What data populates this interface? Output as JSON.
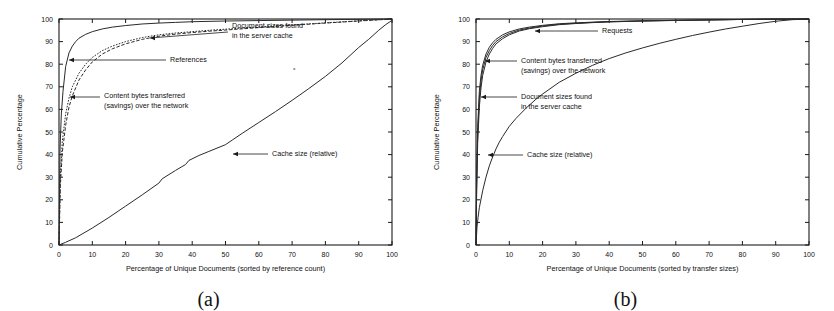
{
  "figure": {
    "caption_a": "(a)",
    "caption_b": "(b)",
    "background": "#ffffff",
    "ink": "#1a1a1a"
  },
  "chart_data": [
    {
      "panel": "a",
      "type": "line",
      "title": "",
      "xlabel": "Percentage of Unique Documents (sorted by reference count)",
      "ylabel": "Cumulative Percentage",
      "xlim": [
        0,
        100
      ],
      "ylim": [
        0,
        100
      ],
      "xticks": [
        0,
        10,
        20,
        30,
        40,
        50,
        60,
        70,
        80,
        90,
        100
      ],
      "yticks": [
        0,
        10,
        20,
        30,
        40,
        50,
        60,
        70,
        80,
        90,
        100
      ],
      "grid": false,
      "legend": "inline-annotations",
      "series": [
        {
          "name": "References",
          "style": "solid",
          "x": [
            0,
            0.3,
            0.7,
            1.2,
            2,
            3,
            4,
            5,
            6,
            8,
            10,
            13,
            16,
            20,
            25,
            30,
            35,
            40,
            50,
            60,
            70,
            80,
            90,
            100
          ],
          "y": [
            0,
            42,
            58,
            68,
            79,
            85,
            88,
            90,
            91.5,
            93.2,
            94.4,
            95.6,
            96.4,
            97.1,
            97.8,
            98.2,
            98.5,
            98.8,
            99.1,
            99.3,
            99.5,
            99.7,
            99.85,
            100
          ]
        },
        {
          "name": "Document sizes found in the server cache",
          "style": "dotted",
          "x": [
            0,
            0.4,
            1,
            2,
            3,
            4,
            6,
            8,
            10,
            13,
            16,
            20,
            25,
            30,
            35,
            40,
            45,
            50,
            60,
            70,
            80,
            90,
            100
          ],
          "y": [
            0,
            30,
            46,
            58,
            65,
            70,
            76,
            80,
            83,
            86,
            88,
            90,
            91.8,
            93,
            93.8,
            94.4,
            95,
            95.5,
            96.5,
            97.4,
            98.3,
            99.2,
            100
          ]
        },
        {
          "name": "Content bytes transferred (savings) over the network",
          "style": "dashed",
          "x": [
            0,
            0.4,
            1,
            2,
            3,
            4,
            6,
            8,
            10,
            13,
            16,
            20,
            25,
            30,
            35,
            40,
            45,
            50,
            60,
            70,
            80,
            90,
            100
          ],
          "y": [
            0,
            26,
            41,
            53,
            61,
            66,
            73,
            77.5,
            81,
            84.5,
            86.8,
            89,
            91,
            92.4,
            93.3,
            94,
            94.6,
            95.1,
            96.2,
            97.2,
            98.2,
            99.1,
            100
          ]
        },
        {
          "name": "Cache size (relative)",
          "style": "solid",
          "x": [
            0,
            2,
            5,
            10,
            15,
            18,
            20,
            25,
            30,
            31,
            35,
            38,
            39,
            42,
            45,
            50,
            52,
            55,
            60,
            65,
            70,
            75,
            80,
            85,
            90,
            93,
            96,
            98,
            100
          ],
          "y": [
            0,
            1.2,
            3.2,
            7.5,
            12.2,
            15.2,
            17.2,
            22.2,
            27.4,
            29.3,
            33.0,
            35.6,
            37.4,
            39.6,
            41.4,
            44.4,
            46.4,
            49.4,
            54.2,
            59.0,
            64.0,
            69.2,
            74.6,
            80.6,
            87.4,
            91.0,
            95.0,
            97.4,
            99.4
          ]
        }
      ],
      "annotations": [
        {
          "text_lines": [
            "Document sizes found",
            "in the server cache"
          ],
          "target_x": 31,
          "target_y": 94
        },
        {
          "text_lines": [
            "References"
          ],
          "target_x": 2,
          "target_y": 82
        },
        {
          "text_lines": [
            "Content bytes transferred",
            "(savings) over the network"
          ],
          "target_x": 1.2,
          "target_y": 68
        },
        {
          "text_lines": [
            "Cache size (relative)"
          ],
          "target_x": 51,
          "target_y": 43
        }
      ]
    },
    {
      "panel": "b",
      "type": "line",
      "title": "",
      "xlabel": "Percentage of Unique Documents (sorted by transfer sizes)",
      "ylabel": "Cumulative Percentage",
      "xlim": [
        0,
        100
      ],
      "ylim": [
        0,
        100
      ],
      "xticks": [
        0,
        10,
        20,
        30,
        40,
        50,
        60,
        70,
        80,
        90,
        100
      ],
      "yticks": [
        0,
        10,
        20,
        30,
        40,
        50,
        60,
        70,
        80,
        90,
        100
      ],
      "grid": false,
      "legend": "inline-annotations",
      "series": [
        {
          "name": "Requests",
          "style": "solid",
          "x": [
            0,
            0.2,
            0.5,
            1,
            1.5,
            2,
            3,
            4,
            5,
            6,
            8,
            10,
            13,
            16,
            20,
            25,
            30,
            35,
            40,
            50,
            60,
            70,
            80,
            90,
            100
          ],
          "y": [
            0,
            30,
            52,
            68,
            75,
            79.5,
            84.5,
            87.5,
            89.5,
            91,
            93,
            94.3,
            95.6,
            96.4,
            97.2,
            97.9,
            98.3,
            98.6,
            98.9,
            99.2,
            99.4,
            99.6,
            99.8,
            99.95,
            100
          ]
        },
        {
          "name": "Content bytes transferred (savings) over the network",
          "style": "solid",
          "x": [
            0,
            0.2,
            0.5,
            1,
            1.5,
            2,
            3,
            4,
            5,
            6,
            8,
            10,
            13,
            16,
            20,
            25,
            30,
            35,
            40,
            50,
            60,
            70,
            80,
            90,
            100
          ],
          "y": [
            0,
            27,
            49,
            65,
            72.5,
            77.5,
            83,
            86,
            88.3,
            90,
            92.1,
            93.6,
            95.1,
            96.0,
            96.9,
            97.7,
            98.1,
            98.5,
            98.8,
            99.15,
            99.4,
            99.6,
            99.8,
            99.95,
            100
          ]
        },
        {
          "name": "Document sizes found in the server cache",
          "style": "solid",
          "x": [
            0,
            0.2,
            0.5,
            1,
            1.5,
            2,
            3,
            4,
            5,
            6,
            8,
            10,
            13,
            16,
            20,
            25,
            30,
            35,
            40,
            50,
            60,
            70,
            80,
            90,
            100
          ],
          "y": [
            0,
            24,
            45,
            61,
            69.5,
            75,
            81,
            84.5,
            87,
            89,
            91.3,
            93,
            94.7,
            95.7,
            96.6,
            97.5,
            98.0,
            98.4,
            98.7,
            99.1,
            99.35,
            99.6,
            99.8,
            99.95,
            100
          ]
        },
        {
          "name": "Cache size (relative)",
          "style": "solid",
          "x": [
            0,
            0.3,
            0.6,
            1,
            2,
            3,
            4,
            5,
            6,
            7,
            8,
            10,
            12,
            15,
            18,
            20,
            25,
            30,
            35,
            40,
            45,
            50,
            55,
            60,
            65,
            70,
            75,
            80,
            85,
            90,
            95,
            100
          ],
          "y": [
            0,
            8,
            12,
            16.5,
            24,
            30,
            35,
            39,
            42.5,
            45.5,
            48,
            52.5,
            56,
            60.5,
            64.5,
            66.8,
            72,
            76,
            79.5,
            82.5,
            85,
            87.2,
            89.2,
            91,
            92.7,
            94.2,
            95.6,
            96.8,
            98,
            99,
            99.7,
            100
          ]
        }
      ],
      "annotations": [
        {
          "text_lines": [
            "Requests"
          ],
          "target_x": 22,
          "target_y": 97.2
        },
        {
          "text_lines": [
            "Content bytes transferred",
            "(savings) over the network"
          ],
          "target_x": 2.5,
          "target_y": 84
        },
        {
          "text_lines": [
            "Document sizes found",
            "in the server cache"
          ],
          "target_x": 1,
          "target_y": 70.5
        },
        {
          "text_lines": [
            "Cache size (relative)"
          ],
          "target_x": 6.5,
          "target_y": 43
        }
      ]
    }
  ]
}
